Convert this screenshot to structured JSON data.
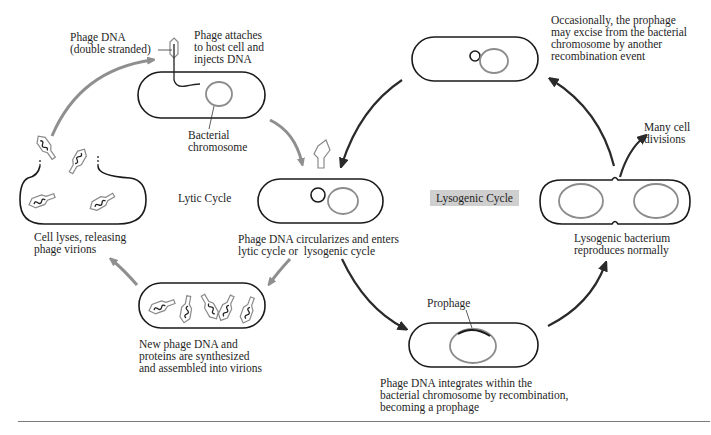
{
  "diagram": {
    "cycles": {
      "lytic_label": "Lytic Cycle",
      "lysogenic_label": "Lysogenic Cycle"
    },
    "labels": {
      "phage_dna": "Phage DNA\n(double stranded)",
      "phage_attaches": "Phage attaches\nto host cell and\ninjects DNA",
      "bacterial_chromosome": "Bacterial\nchromosome",
      "circularizes": "Phage DNA circularizes and enters\nlytic cycle or  lysogenic cycle",
      "cell_lyses": "Cell lyses, releasing\nphage virions",
      "new_phage": "New phage DNA and\nproteins are synthesized\nand assembled into virions",
      "prophage": "Prophage",
      "integrates": "Phage DNA integrates within the\nbacterial chromosome by recombination,\nbecoming a prophage",
      "lysogenic_bacterium": "Lysogenic bacterium\nreproduces normally",
      "many_divisions": "Many cell\ndivisions",
      "excise": "Occasionally, the prophage\nmay excise from the bacterial\nchromosome by another\nrecombination event"
    },
    "colors": {
      "cell_outline": "#1a1a1a",
      "chromosome": "#8c8c8c",
      "lytic_arrow": "#8f8f8f",
      "lysogenic_arrow": "#2a2a2a",
      "lysogenic_tag_bg": "#cfcfcf",
      "rule": "#7a7a7a"
    }
  }
}
